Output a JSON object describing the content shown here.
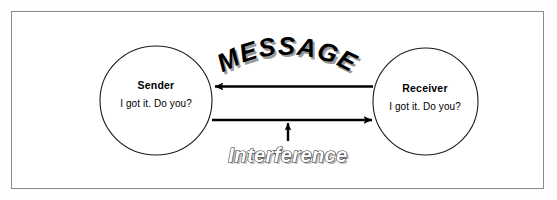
{
  "diagram": {
    "background_color": "#ffffff",
    "frame_color": "#8a8a8a",
    "ink_color": "#000000",
    "nodes": [
      {
        "id": "sender",
        "label": "Sender",
        "quote": "I got it. Do you?",
        "shape": "circle"
      },
      {
        "id": "receiver",
        "label": "Receiver",
        "quote": "I got it. Do you?",
        "shape": "circle"
      }
    ],
    "connectors": [
      {
        "id": "message-arrow-top",
        "label": "MESSAGE",
        "direction": "right-to-left",
        "from": "receiver",
        "to": "sender"
      },
      {
        "id": "message-arrow-bottom",
        "label": "",
        "direction": "left-to-right",
        "from": "sender",
        "to": "receiver"
      },
      {
        "id": "interference-arrow",
        "label": "Interference",
        "direction": "bottom-to-top",
        "from": "interference-label",
        "to": "message-arrow-bottom"
      }
    ],
    "labels": {
      "message": "MESSAGE",
      "message_style": "arched-bold-shadow",
      "interference": "Interference",
      "interference_style": "italic-outline-shadow"
    }
  }
}
